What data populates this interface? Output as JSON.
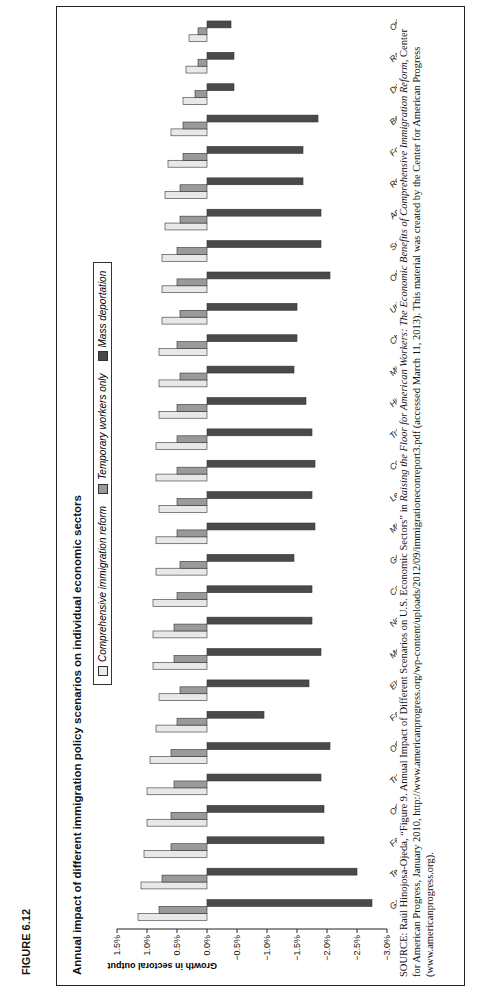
{
  "figure_label": "FIGURE 6.12",
  "chart_data": {
    "type": "bar",
    "orientation": "vertical (figure printed rotated 90°)",
    "title": "Annual impact of different immigration policy scenarios on individual economic sectors",
    "xlabel": "",
    "ylabel": "Growth in sectoral output",
    "ylim": [
      -3.0,
      1.5
    ],
    "yticks": [
      "1.5%",
      "1.0%",
      "0.5%",
      "0.0%",
      "−0.5%",
      "−1.0%",
      "−1.5%",
      "−2.0%",
      "−2.5%",
      "−3.0%"
    ],
    "grid": false,
    "legend_position": "top",
    "categories": [
      "Garments",
      "Textiles",
      "Ferrous metals",
      "Other metals and products",
      "Transportation equipment",
      "Other manufactures",
      "Factor-skilled labor",
      "Electronic equipment",
      "Motor vehicles and parts",
      "Nonelectric machinery and equipment",
      "Capital goods",
      "Government and misc. services",
      "Mineral products",
      "Leather, wood and paper products",
      "Construction",
      "Trade and transport",
      "High-tech services (F.I.R.E.)",
      "Mining",
      "Chemicals, plastic and rubber",
      "Utilities",
      "Other processed foods",
      "Sugar",
      "Animals and animal products",
      "Refined energy",
      "Forestry and fisheries",
      "Beverage and tobacco",
      "Dwellings",
      "Raw energy",
      "Other agriculture"
    ],
    "series": [
      {
        "name": "Comprehensive immigration reform",
        "color": "#e8e8e8",
        "values": [
          1.15,
          1.1,
          1.05,
          1.0,
          1.0,
          0.95,
          0.85,
          0.8,
          0.9,
          0.9,
          0.9,
          0.85,
          0.85,
          0.8,
          0.85,
          0.85,
          0.8,
          0.8,
          0.8,
          0.75,
          0.75,
          0.75,
          0.7,
          0.7,
          0.65,
          0.6,
          0.4,
          0.35,
          0.3
        ]
      },
      {
        "name": "Temporary workers only",
        "color": "#9a9a9a",
        "values": [
          0.8,
          0.75,
          0.6,
          0.6,
          0.55,
          0.6,
          0.5,
          0.45,
          0.55,
          0.55,
          0.5,
          0.45,
          0.5,
          0.5,
          0.5,
          0.5,
          0.5,
          0.45,
          0.5,
          0.45,
          0.5,
          0.5,
          0.45,
          0.45,
          0.4,
          0.4,
          0.2,
          0.15,
          0.15
        ]
      },
      {
        "name": "Mass deportation",
        "color": "#4a4a4a",
        "values": [
          -2.75,
          -2.5,
          -1.95,
          -1.95,
          -1.9,
          -2.05,
          -0.95,
          -1.7,
          -1.9,
          -1.75,
          -1.75,
          -1.45,
          -1.8,
          -1.75,
          -1.8,
          -1.75,
          -1.65,
          -1.45,
          -1.5,
          -1.5,
          -2.05,
          -1.9,
          -1.9,
          -1.6,
          -1.6,
          -1.85,
          -0.45,
          -0.45,
          -0.4
        ]
      }
    ]
  },
  "legend": {
    "items": [
      {
        "label": "Comprehensive immigration reform",
        "color": "#e8e8e8"
      },
      {
        "label": "Temporary workers only",
        "color": "#9a9a9a"
      },
      {
        "label": "Mass deportation",
        "color": "#4a4a4a"
      }
    ]
  },
  "source": {
    "prefix": "SOURCE:",
    "text1": "Raúl Hinojosa-Ojeda, “Figure 9. Annual Impact of Different Scenarios on U.S. Economic Sectors” in ",
    "italic": "Raising the Floor for American Workers: The Economic Benefits of Comprehensive Immigration Reform",
    "text2": ", Center for American Progress, January 2010, http://www.americanprogress.org/wp-content/uploads/2012/09/immigrationeconreport3.pdf (accessed March 11, 2013). This material was created by the Center for American Progress (www.americanprogress.org)."
  }
}
